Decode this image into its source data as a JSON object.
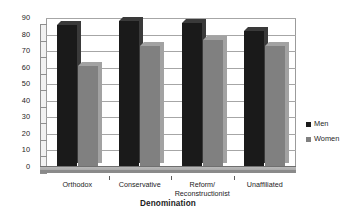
{
  "chart_data": {
    "type": "bar",
    "title": "",
    "subtitle": "",
    "xlabel": "Denomination",
    "ylabel": "In labor force (%)",
    "categories": [
      "Orthodox",
      "Conservative",
      "Reform/\nReconstructionist",
      "Unaffiliated"
    ],
    "series": [
      {
        "name": "Men",
        "values": [
          86,
          88,
          87,
          82
        ],
        "color": "#1a1a1a"
      },
      {
        "name": "Women",
        "values": [
          61,
          73,
          77,
          73
        ],
        "color": "#808080"
      }
    ],
    "ylim": [
      0,
      90
    ],
    "ytick_values": [
      0,
      10,
      20,
      30,
      40,
      50,
      60,
      70,
      80,
      90
    ],
    "ytick_labels": [
      "0",
      "10",
      "20",
      "30",
      "40",
      "50",
      "60",
      "70",
      "80",
      "90"
    ],
    "grid": true,
    "grid_axis": "y",
    "legend_position": "right",
    "style": "3d-clustered-bar",
    "colors": {
      "men": "#1a1a1a",
      "women": "#808080",
      "men_side": "#3a3a3a",
      "women_side": "#a2a2a2",
      "gridline": "#a6a6a6",
      "axis": "#6f6f6f",
      "plot_background": "#ffffff",
      "floor": "#a8a8a8",
      "text": "#1d1d1d"
    }
  },
  "legend": {
    "items": [
      {
        "label": "Men",
        "color": "#1a1a1a"
      },
      {
        "label": "Women",
        "color": "#808080"
      }
    ]
  }
}
